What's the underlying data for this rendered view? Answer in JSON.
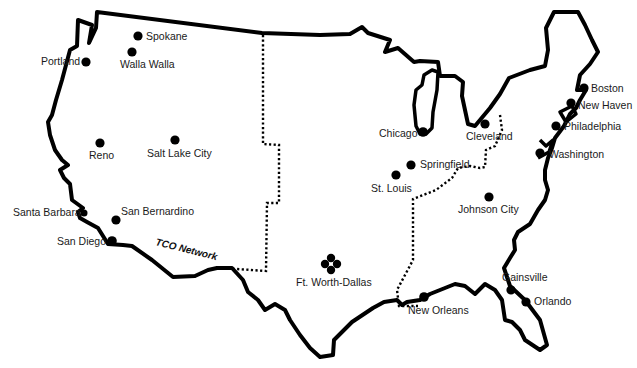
{
  "map": {
    "title": "TCO Network",
    "network_label": "TCO Network",
    "colors": {
      "ink": "#000000",
      "background": "#ffffff"
    },
    "cities": [
      {
        "name": "Spokane"
      },
      {
        "name": "Walla Walla"
      },
      {
        "name": "Portland"
      },
      {
        "name": "Reno"
      },
      {
        "name": "Salt Lake City"
      },
      {
        "name": "Santa Barbara"
      },
      {
        "name": "San Bernardino"
      },
      {
        "name": "San Diego"
      },
      {
        "name": "Ft. Worth-Dallas"
      },
      {
        "name": "Chicago"
      },
      {
        "name": "Cleveland"
      },
      {
        "name": "Springfield"
      },
      {
        "name": "St. Louis"
      },
      {
        "name": "Johnson City"
      },
      {
        "name": "New Orleans"
      },
      {
        "name": "Gainsville"
      },
      {
        "name": "Orlando"
      },
      {
        "name": "Boston"
      },
      {
        "name": "New Haven"
      },
      {
        "name": "Philadelphia"
      },
      {
        "name": "Washington"
      }
    ]
  }
}
